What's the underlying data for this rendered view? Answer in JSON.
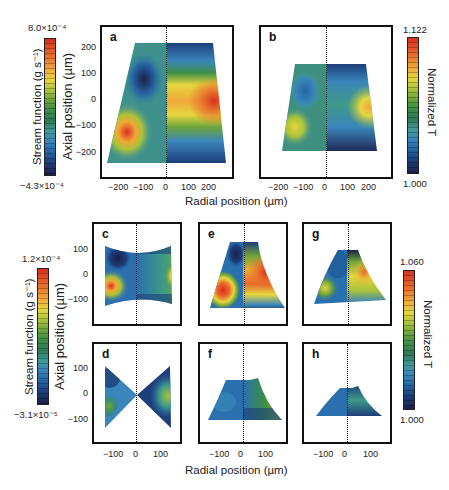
{
  "figure": {
    "top_section": {
      "colorbar_left": {
        "max_label": "8.0×10⁻⁴",
        "min_label": "−4.3×10⁻⁴",
        "title": "Stream function (g s⁻¹)"
      },
      "y_axis_label": "Axial position (µm)",
      "x_axis_label": "Radial position (µm)",
      "colorbar_right": {
        "max_label": "1.122",
        "min_label": "1.000",
        "title": "Normalized T"
      },
      "panels": [
        {
          "label": "a",
          "yticks": [
            "200",
            "100",
            "0",
            "−100",
            "−200"
          ],
          "xticks": [
            "−200",
            "−100",
            "0",
            "100",
            "200"
          ]
        },
        {
          "label": "b",
          "xticks": [
            "−200",
            "−100",
            "0",
            "100",
            "200"
          ]
        }
      ]
    },
    "bottom_section": {
      "colorbar_left": {
        "max_label": "1.2×10⁻⁴",
        "min_label": "−3.1×10⁻⁵",
        "title": "Stream function (g s⁻¹)"
      },
      "y_axis_label": "Axial position (µm)",
      "x_axis_label": "Radial position (µm)",
      "colorbar_right": {
        "max_label": "1.060",
        "min_label": "1.000",
        "title": "Normalized T"
      },
      "panels": [
        {
          "label": "c",
          "yticks": [
            "100",
            "0",
            "−100"
          ]
        },
        {
          "label": "e"
        },
        {
          "label": "g"
        },
        {
          "label": "d",
          "yticks": [
            "100",
            "0",
            "−100"
          ],
          "xticks": [
            "−100",
            "0",
            "100"
          ]
        },
        {
          "label": "f",
          "xticks": [
            "−100",
            "0",
            "100"
          ]
        },
        {
          "label": "h",
          "xticks": [
            "−100",
            "0",
            "100"
          ]
        }
      ]
    },
    "colormap": [
      "#1b1f4a",
      "#1d3e7a",
      "#2563a3",
      "#3a86bb",
      "#3f9a9a",
      "#2f7a55",
      "#3e8e45",
      "#6ea53a",
      "#a8c23a",
      "#e6d640",
      "#f0a838",
      "#e96a2a",
      "#d8301f"
    ]
  }
}
